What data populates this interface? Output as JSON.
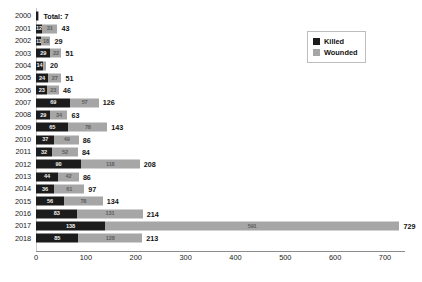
{
  "chart_data": {
    "type": "bar",
    "orientation": "horizontal",
    "stacked": true,
    "title": "",
    "xlabel": "",
    "ylabel": "",
    "xlim": [
      0,
      740
    ],
    "xticks": [
      0,
      100,
      200,
      300,
      400,
      500,
      600,
      700
    ],
    "grid": false,
    "legend_position": "top-right",
    "categories": [
      "2000",
      "2001",
      "2002",
      "2003",
      "2004",
      "2005",
      "2006",
      "2007",
      "2008",
      "2009",
      "2010",
      "2011",
      "2012",
      "2013",
      "2014",
      "2015",
      "2016",
      "2017",
      "2018"
    ],
    "series": [
      {
        "name": "Killed",
        "color": "#1c1c1c",
        "values": [
          4,
          12,
          11,
          29,
          14,
          24,
          23,
          69,
          29,
          65,
          37,
          32,
          90,
          44,
          36,
          56,
          83,
          138,
          85
        ]
      },
      {
        "name": "Wounded",
        "color": "#a6a6a6",
        "values": [
          3,
          31,
          18,
          22,
          6,
          27,
          23,
          57,
          34,
          78,
          49,
          52,
          118,
          42,
          61,
          78,
          131,
          591,
          128
        ]
      }
    ],
    "totals": [
      7,
      43,
      29,
      51,
      20,
      51,
      46,
      126,
      63,
      143,
      86,
      84,
      208,
      86,
      97,
      134,
      214,
      729,
      213
    ],
    "annotations": [
      {
        "category": "2000",
        "text": "Total: 7"
      }
    ]
  },
  "rows": [
    {
      "year": "2000",
      "killed": 4,
      "wounded": 3,
      "total_label": "Total: 7",
      "killed_label": "",
      "wounded_label": ""
    },
    {
      "year": "2001",
      "killed": 12,
      "wounded": 31,
      "total_label": "43",
      "killed_label": "12",
      "wounded_label": "31"
    },
    {
      "year": "2002",
      "killed": 11,
      "wounded": 18,
      "total_label": "29",
      "killed_label": "11",
      "wounded_label": "18"
    },
    {
      "year": "2003",
      "killed": 29,
      "wounded": 22,
      "total_label": "51",
      "killed_label": "29",
      "wounded_label": "22"
    },
    {
      "year": "2004",
      "killed": 14,
      "wounded": 6,
      "total_label": "20",
      "killed_label": "14",
      "wounded_label": ""
    },
    {
      "year": "2005",
      "killed": 24,
      "wounded": 27,
      "total_label": "51",
      "killed_label": "24",
      "wounded_label": "27"
    },
    {
      "year": "2006",
      "killed": 23,
      "wounded": 23,
      "total_label": "46",
      "killed_label": "23",
      "wounded_label": "23"
    },
    {
      "year": "2007",
      "killed": 69,
      "wounded": 57,
      "total_label": "126",
      "killed_label": "69",
      "wounded_label": "57"
    },
    {
      "year": "2008",
      "killed": 29,
      "wounded": 34,
      "total_label": "63",
      "killed_label": "29",
      "wounded_label": "34"
    },
    {
      "year": "2009",
      "killed": 65,
      "wounded": 78,
      "total_label": "143",
      "killed_label": "65",
      "wounded_label": "78"
    },
    {
      "year": "2010",
      "killed": 37,
      "wounded": 49,
      "total_label": "86",
      "killed_label": "37",
      "wounded_label": "49"
    },
    {
      "year": "2011",
      "killed": 32,
      "wounded": 52,
      "total_label": "84",
      "killed_label": "32",
      "wounded_label": "52"
    },
    {
      "year": "2012",
      "killed": 90,
      "wounded": 118,
      "total_label": "208",
      "killed_label": "90",
      "wounded_label": "118"
    },
    {
      "year": "2013",
      "killed": 44,
      "wounded": 42,
      "total_label": "86",
      "killed_label": "44",
      "wounded_label": "42"
    },
    {
      "year": "2014",
      "killed": 36,
      "wounded": 61,
      "total_label": "97",
      "killed_label": "36",
      "wounded_label": "61"
    },
    {
      "year": "2015",
      "killed": 56,
      "wounded": 78,
      "total_label": "134",
      "killed_label": "56",
      "wounded_label": "78"
    },
    {
      "year": "2016",
      "killed": 83,
      "wounded": 131,
      "total_label": "214",
      "killed_label": "83",
      "wounded_label": "131"
    },
    {
      "year": "2017",
      "killed": 138,
      "wounded": 591,
      "total_label": "729",
      "killed_label": "138",
      "wounded_label": "591"
    },
    {
      "year": "2018",
      "killed": 85,
      "wounded": 128,
      "total_label": "213",
      "killed_label": "85",
      "wounded_label": "128"
    }
  ],
  "axis": {
    "ticks": [
      "0",
      "100",
      "200",
      "300",
      "400",
      "500",
      "600",
      "700"
    ]
  },
  "legend": {
    "items": [
      {
        "label": "Killed",
        "color": "#1c1c1c"
      },
      {
        "label": "Wounded",
        "color": "#a6a6a6"
      }
    ]
  },
  "scale": {
    "origin_px": 36,
    "px_per_unit": 0.4986
  }
}
